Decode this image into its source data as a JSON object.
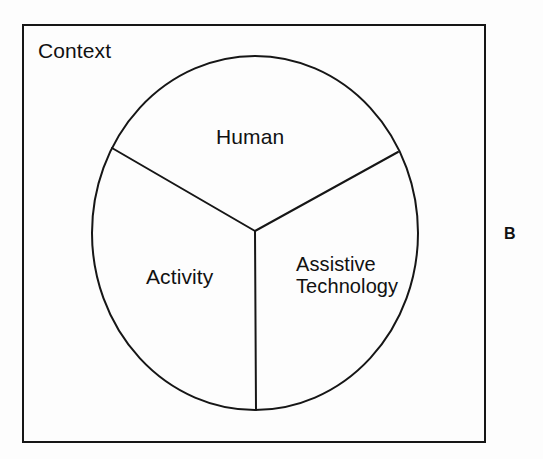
{
  "figure": {
    "panel_label": "B",
    "frame_label": "Context",
    "background_color": "#fdfdfd",
    "stroke_color": "#161616",
    "text_color": "#111111"
  },
  "diagram": {
    "type": "venn-pie",
    "outer_region": {
      "name": "context-frame",
      "label": "Context",
      "shape": "rectangle"
    },
    "circle": {
      "center_x": 255,
      "center_y": 233,
      "radius_x": 163,
      "radius_y": 177,
      "segments": 3
    },
    "segments": [
      {
        "id": "human",
        "label": "Human",
        "position": "top"
      },
      {
        "id": "activity",
        "label": "Activity",
        "position": "lower-left"
      },
      {
        "id": "assistive-technology",
        "label": "Assistive Technology",
        "label_line_1": "Assistive",
        "label_line_2": "Technology",
        "position": "lower-right"
      }
    ],
    "divider_lines": [
      {
        "id": "divider-upper-left",
        "from_x": 255,
        "from_y": 231,
        "to_x": 112,
        "to_y": 148
      },
      {
        "id": "divider-upper-right",
        "from_x": 255,
        "from_y": 231,
        "to_x": 398,
        "to_y": 152
      },
      {
        "id": "divider-lower",
        "from_x": 255,
        "from_y": 231,
        "to_x": 256,
        "to_y": 410
      }
    ]
  }
}
